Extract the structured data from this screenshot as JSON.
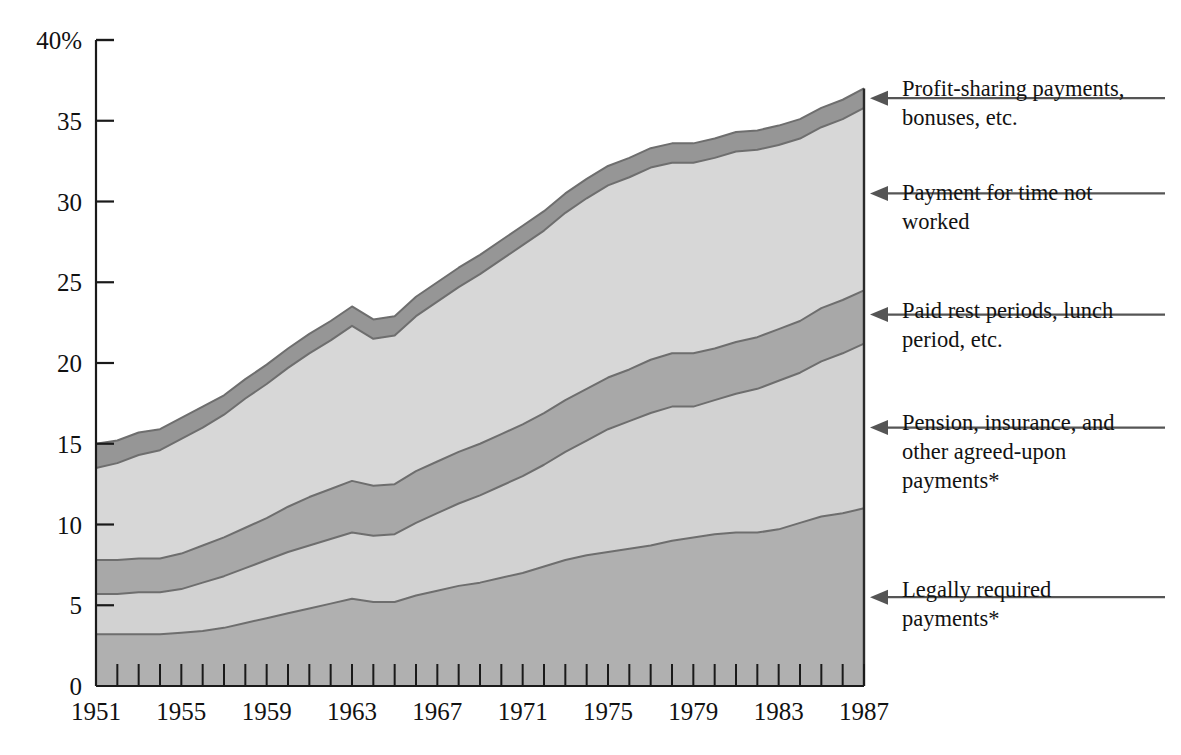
{
  "chart_data": {
    "type": "area",
    "title": "",
    "subtitle": "",
    "xlabel": "",
    "ylabel": "",
    "stacked": true,
    "grid": false,
    "legend_position": "right-arrows",
    "xlim": [
      1951,
      1987
    ],
    "ylim": [
      0,
      40
    ],
    "y_ticks": [
      0,
      5,
      10,
      15,
      20,
      25,
      30,
      35,
      40
    ],
    "y_tick_labels": [
      "0",
      "5",
      "10",
      "15",
      "20",
      "25",
      "30",
      "35",
      "40%"
    ],
    "x_ticks": [
      1951,
      1955,
      1959,
      1963,
      1967,
      1971,
      1975,
      1979,
      1983,
      1987
    ],
    "x_tick_labels": [
      "1951",
      "1955",
      "1959",
      "1963",
      "1967",
      "1971",
      "1975",
      "1979",
      "1983",
      "1987"
    ],
    "x_minor_tick_every": 1,
    "x": [
      1951,
      1952,
      1953,
      1954,
      1955,
      1956,
      1957,
      1958,
      1959,
      1960,
      1961,
      1962,
      1963,
      1964,
      1965,
      1966,
      1967,
      1968,
      1969,
      1970,
      1971,
      1972,
      1973,
      1974,
      1975,
      1976,
      1977,
      1978,
      1979,
      1980,
      1981,
      1982,
      1983,
      1984,
      1985,
      1986,
      1987
    ],
    "series": [
      {
        "name": "Legally required payments*",
        "color": "#b0b0b0",
        "values": [
          3.2,
          3.2,
          3.2,
          3.2,
          3.3,
          3.4,
          3.6,
          3.9,
          4.2,
          4.5,
          4.8,
          5.1,
          5.4,
          5.2,
          5.2,
          5.6,
          5.9,
          6.2,
          6.4,
          6.7,
          7.0,
          7.4,
          7.8,
          8.1,
          8.3,
          8.5,
          8.7,
          9.0,
          9.2,
          9.4,
          9.5,
          9.5,
          9.7,
          10.1,
          10.5,
          10.7,
          11.0
        ]
      },
      {
        "name": "Pension, insurance, and other agreed-upon payments*",
        "color": "#d2d2d2",
        "values": [
          2.5,
          2.5,
          2.6,
          2.6,
          2.7,
          3.0,
          3.2,
          3.4,
          3.6,
          3.8,
          3.9,
          4.0,
          4.1,
          4.1,
          4.2,
          4.5,
          4.8,
          5.1,
          5.4,
          5.7,
          6.0,
          6.3,
          6.7,
          7.1,
          7.6,
          7.9,
          8.2,
          8.3,
          8.1,
          8.3,
          8.6,
          8.9,
          9.2,
          9.3,
          9.6,
          9.9,
          10.2
        ]
      },
      {
        "name": "Paid rest periods, lunch period, etc.",
        "color": "#a8a8a8",
        "values": [
          2.1,
          2.1,
          2.1,
          2.1,
          2.2,
          2.3,
          2.4,
          2.5,
          2.6,
          2.8,
          3.0,
          3.1,
          3.2,
          3.1,
          3.1,
          3.2,
          3.2,
          3.2,
          3.2,
          3.2,
          3.2,
          3.2,
          3.2,
          3.2,
          3.2,
          3.2,
          3.3,
          3.3,
          3.3,
          3.2,
          3.2,
          3.2,
          3.2,
          3.2,
          3.3,
          3.3,
          3.3
        ]
      },
      {
        "name": "Payment for time not worked",
        "color": "#d7d7d7",
        "values": [
          5.7,
          6.0,
          6.4,
          6.7,
          7.1,
          7.3,
          7.6,
          8.0,
          8.3,
          8.6,
          8.9,
          9.2,
          9.6,
          9.1,
          9.2,
          9.6,
          9.9,
          10.2,
          10.5,
          10.8,
          11.1,
          11.3,
          11.6,
          11.8,
          11.9,
          11.9,
          11.9,
          11.8,
          11.8,
          11.8,
          11.8,
          11.6,
          11.4,
          11.3,
          11.2,
          11.2,
          11.3
        ]
      },
      {
        "name": "Profit-sharing payments, bonuses, etc.",
        "color": "#969696",
        "values": [
          1.5,
          1.4,
          1.4,
          1.3,
          1.3,
          1.3,
          1.2,
          1.2,
          1.2,
          1.2,
          1.2,
          1.2,
          1.2,
          1.2,
          1.2,
          1.2,
          1.2,
          1.2,
          1.2,
          1.2,
          1.2,
          1.2,
          1.2,
          1.2,
          1.2,
          1.2,
          1.2,
          1.2,
          1.2,
          1.2,
          1.2,
          1.2,
          1.2,
          1.2,
          1.2,
          1.2,
          1.2
        ]
      }
    ],
    "cumulative_top_1951": 15.0,
    "cumulative_top_1987": 37.0
  },
  "annotations": [
    {
      "id": "profit-sharing",
      "lines": [
        "Profit-sharing payments,",
        "bonuses, etc."
      ],
      "target_value": 36.4,
      "label_y": 96
    },
    {
      "id": "time-not-worked",
      "lines": [
        "Payment for time not",
        "worked"
      ],
      "target_value": 30.5,
      "label_y": 200
    },
    {
      "id": "paid-rest-periods",
      "lines": [
        "Paid rest periods, lunch",
        "period, etc."
      ],
      "target_value": 23.0,
      "label_y": 318
    },
    {
      "id": "pension-insurance",
      "lines": [
        "Pension, insurance, and",
        "other agreed-upon",
        "payments*"
      ],
      "target_value": 16.0,
      "label_y": 430
    },
    {
      "id": "legally-required",
      "lines": [
        "Legally required",
        "payments*"
      ],
      "target_value": 5.5,
      "label_y": 597
    }
  ],
  "colors": {
    "band_bottom": "#b0b0b0",
    "band_2": "#d2d2d2",
    "band_3": "#a8a8a8",
    "band_4": "#d7d7d7",
    "band_top": "#969696",
    "outline": "#6e6e6e",
    "axis": "#1a1a1a",
    "leader": "#555555",
    "background": "#ffffff"
  }
}
